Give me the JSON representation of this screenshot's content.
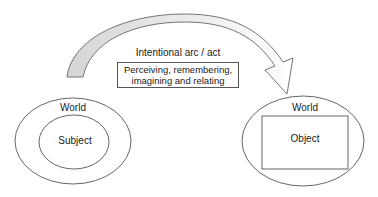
{
  "diagram": {
    "arrow": {
      "label": "Intentional arc / act",
      "description_lines": [
        "Perceiving, remembering,",
        "imagining and relating"
      ],
      "gradient_start": "#d9d9d9",
      "gradient_end": "#ffffff",
      "stroke": "#666666"
    },
    "left_group": {
      "outer_label": "World",
      "inner_label": "Subject"
    },
    "right_group": {
      "outer_label": "World",
      "inner_label": "Object"
    }
  }
}
